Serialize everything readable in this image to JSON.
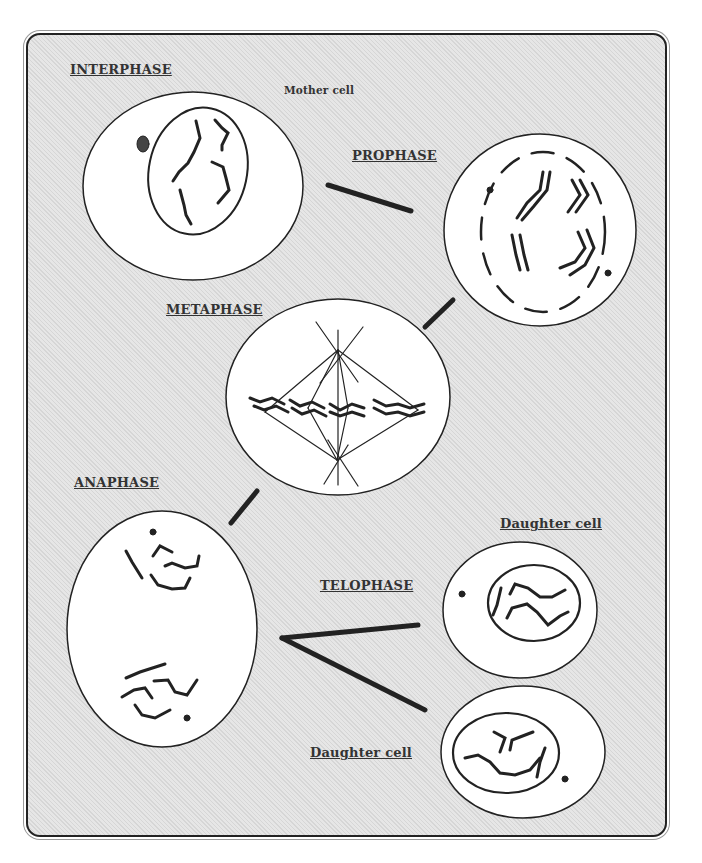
{
  "diagram": {
    "type": "mitosis-stages",
    "colors": {
      "background": "#e0e0e0",
      "cell_fill": "#ffffff",
      "stroke": "#222222",
      "text": "#333333"
    },
    "stages": [
      {
        "id": "interphase",
        "label": "INTERPHASE",
        "note": "Mother cell"
      },
      {
        "id": "prophase",
        "label": "PROPHASE"
      },
      {
        "id": "metaphase",
        "label": "METAPHASE"
      },
      {
        "id": "anaphase",
        "label": "ANAPHASE"
      },
      {
        "id": "telophase",
        "label": "TELOPHASE"
      }
    ],
    "daughter_labels": [
      "Daughter cell",
      "Daughter cell"
    ],
    "connections": [
      {
        "from": "interphase",
        "to": "prophase"
      },
      {
        "from": "prophase",
        "to": "metaphase"
      },
      {
        "from": "metaphase",
        "to": "anaphase"
      },
      {
        "from": "anaphase",
        "to": "telophase-daughter-top"
      },
      {
        "from": "anaphase",
        "to": "telophase-daughter-bottom"
      }
    ]
  }
}
